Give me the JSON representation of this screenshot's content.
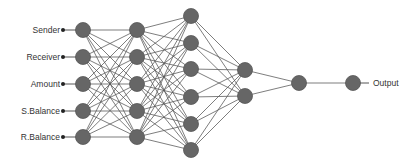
{
  "diagram": {
    "inputs": [
      "Sender",
      "Receiver",
      "Amount",
      "S.Balance",
      "R.Balance"
    ],
    "output_label": "Output",
    "layers": [
      {
        "x": 83,
        "ys": [
          30,
          57,
          84,
          111,
          137
        ]
      },
      {
        "x": 137,
        "ys": [
          30,
          57,
          84,
          111,
          137
        ]
      },
      {
        "x": 191,
        "ys": [
          16,
          43,
          69,
          97,
          124,
          150
        ]
      },
      {
        "x": 245,
        "ys": [
          70,
          96
        ]
      },
      {
        "x": 299,
        "ys": [
          83
        ]
      },
      {
        "x": 353,
        "ys": [
          83
        ]
      }
    ],
    "colors": {
      "node": "#666666",
      "node_stroke": "#555555",
      "edge": "#555555",
      "text": "#333333"
    }
  }
}
